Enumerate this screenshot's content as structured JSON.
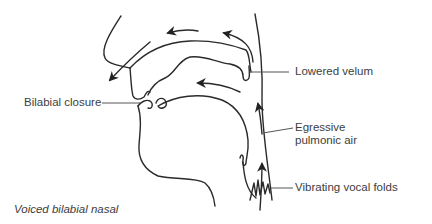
{
  "diagram": {
    "title": "Voiced bilabial nasal",
    "labels": {
      "lowered_velum": "Lowered velum",
      "bilabial_closure": "Bilabial closure",
      "egressive_line1": "Egressive",
      "egressive_line2": "pulmonic air",
      "vocal_folds": "Vibrating vocal folds"
    },
    "colors": {
      "stroke": "#2a2a2a",
      "leader": "#555555",
      "text": "#3d3d3d"
    }
  }
}
